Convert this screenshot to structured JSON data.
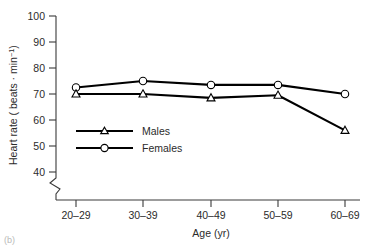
{
  "chart_data": {
    "type": "line",
    "title": "",
    "subtitle": "",
    "xlabel": "Age (yr)",
    "ylabel_main": "Heart rate ( beats · min",
    "ylabel_sup": "−1",
    "ylabel_tail": ")",
    "ylabel_full": "Heart rate ( beats · min−1)",
    "categories": [
      "20–29",
      "30–39",
      "40–49",
      "50–59",
      "60–69"
    ],
    "series": [
      {
        "name": "Males",
        "marker": "triangle-open",
        "color": "#000000",
        "values": [
          70.0,
          70.0,
          68.5,
          69.5,
          56.0
        ]
      },
      {
        "name": "Females",
        "marker": "circle-open",
        "color": "#000000",
        "values": [
          72.5,
          75.0,
          73.5,
          73.5,
          70.0
        ]
      }
    ],
    "ylim": [
      40,
      100
    ],
    "yticks": [
      40,
      50,
      60,
      70,
      80,
      90,
      100
    ],
    "ytick_labels": [
      "40",
      "50",
      "60",
      "70",
      "80",
      "90",
      "100"
    ],
    "axis_break": true,
    "axis_break_note": "zigzag break on y-axis below 40",
    "grid": false,
    "legend_position": "inside-left-lower",
    "legend_entries": [
      "Males",
      "Females"
    ]
  },
  "figure": {
    "panel_label": "(b)"
  }
}
